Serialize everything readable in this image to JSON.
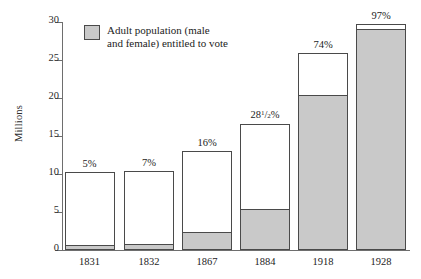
{
  "chart_data": {
    "type": "bar",
    "title": "",
    "subtitle": "",
    "xlabel": "",
    "ylabel": "Millions",
    "ylim": [
      0,
      30
    ],
    "yticks": [
      0,
      5,
      10,
      15,
      20,
      25,
      30
    ],
    "ytick_labels": [
      "0",
      "5",
      "10",
      "15",
      "20",
      "25",
      "30"
    ],
    "grid": false,
    "legend_position": "upper-left",
    "legend": [
      {
        "label": "Adult population (male\nand female) entitled to vote",
        "color": "#c9c9c9"
      }
    ],
    "categories": [
      "1831",
      "1832",
      "1867",
      "1884",
      "1918",
      "1928"
    ],
    "series": [
      {
        "name": "Adult population (male and female) entitled to vote",
        "color": "#c9c9c9",
        "values": [
          0.5,
          0.7,
          2.2,
          5.2,
          20.3,
          29.0
        ]
      },
      {
        "name": "Total adult population",
        "color": "#ffffff",
        "values": [
          10.3,
          10.4,
          13.0,
          16.6,
          25.9,
          29.8
        ]
      }
    ],
    "annotations": [
      {
        "category": "1831",
        "text": "5%"
      },
      {
        "category": "1832",
        "text": "7%"
      },
      {
        "category": "1867",
        "text": "16%"
      },
      {
        "category": "1884",
        "text": "28",
        "fraction_numerator": "1",
        "fraction_denominator": "2",
        "suffix": "%"
      },
      {
        "category": "1918",
        "text": "74%"
      },
      {
        "category": "1928",
        "text": "97%"
      }
    ]
  },
  "axis": {
    "y_title": "Millions",
    "y_ticks": [
      "30",
      "25",
      "20",
      "15",
      "10",
      "5",
      "0"
    ]
  },
  "legend": {
    "label": "Adult population (male\nand female) entitled to vote"
  },
  "bars": [
    {
      "year": "1831",
      "pct": "5%",
      "total": 10.3,
      "grey": 0.5
    },
    {
      "year": "1832",
      "pct": "7%",
      "total": 10.4,
      "grey": 0.7
    },
    {
      "year": "1867",
      "pct": "16%",
      "total": 13.0,
      "grey": 2.2
    },
    {
      "year": "1884",
      "pct": "",
      "total": 16.6,
      "grey": 5.2,
      "pct_whole": "28",
      "pct_num": "1",
      "pct_den": "2",
      "pct_suffix": "%"
    },
    {
      "year": "1918",
      "pct": "74%",
      "total": 25.9,
      "grey": 20.3
    },
    {
      "year": "1928",
      "pct": "97%",
      "total": 29.8,
      "grey": 29.0
    }
  ],
  "colors": {
    "grey_fill": "#c9c9c9",
    "outline": "#4a4a4a",
    "axis": "#6e6e6e",
    "text": "#1c1c1c"
  }
}
